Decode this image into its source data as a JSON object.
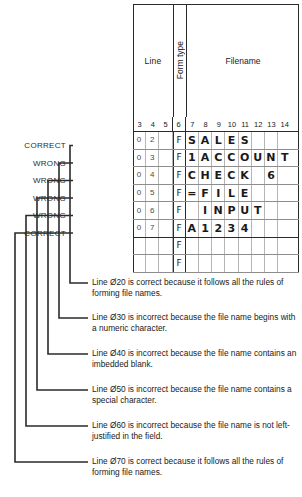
{
  "form": {
    "headers": {
      "line": "Line",
      "form_type": "Form type",
      "filename": "Filename"
    },
    "columns": [
      "3",
      "4",
      "5",
      "6",
      "7",
      "8",
      "9",
      "10",
      "11",
      "12",
      "13",
      "14"
    ],
    "rows": [
      {
        "status": "CORRECT",
        "line_digits": [
          "0",
          "2",
          ""
        ],
        "form_type": "F",
        "filename_cells": [
          "S",
          "A",
          "L",
          "E",
          "S",
          "",
          "",
          ""
        ]
      },
      {
        "status": "WRONG",
        "line_digits": [
          "0",
          "3",
          ""
        ],
        "form_type": "F",
        "filename_cells": [
          "1",
          "A",
          "C",
          "C",
          "O",
          "U",
          "N",
          "T"
        ]
      },
      {
        "status": "WRONG",
        "line_digits": [
          "0",
          "4",
          ""
        ],
        "form_type": "F",
        "filename_cells": [
          "C",
          "H",
          "E",
          "C",
          "K",
          "",
          "6",
          ""
        ]
      },
      {
        "status": "WRONG",
        "line_digits": [
          "0",
          "5",
          ""
        ],
        "form_type": "F",
        "filename_cells": [
          "=",
          "F",
          "I",
          "L",
          "E",
          "",
          "",
          ""
        ]
      },
      {
        "status": "WRONG",
        "line_digits": [
          "0",
          "6",
          ""
        ],
        "form_type": "F",
        "filename_cells": [
          "",
          "I",
          "N",
          "P",
          "U",
          "T",
          "",
          ""
        ]
      },
      {
        "status": "CORRECT",
        "line_digits": [
          "0",
          "7",
          ""
        ],
        "form_type": "F",
        "filename_cells": [
          "A",
          "1",
          "2",
          "3",
          "4",
          "",
          "",
          ""
        ]
      },
      {
        "status": "",
        "line_digits": [
          "",
          "",
          ""
        ],
        "form_type": "F",
        "filename_cells": [
          "",
          "",
          "",
          "",
          "",
          "",
          "",
          ""
        ]
      },
      {
        "status": "",
        "line_digits": [
          "",
          "",
          ""
        ],
        "form_type": "F",
        "filename_cells": [
          "",
          "",
          "",
          "",
          "",
          "",
          "",
          ""
        ]
      }
    ]
  },
  "notes": [
    "Line Ø20 is correct because it follows all the rules of forming file names.",
    "Line Ø30 is incorrect because the file name begins with a numeric character.",
    "Line Ø40 is incorrect because the file name contains an imbedded blank.",
    "Line Ø50 is incorrect because the file name contains a special character.",
    "Line Ø60 is incorrect because the file name is not left-justified in the field.",
    "Line Ø70 is correct because it follows all the rules of forming file names."
  ],
  "colors": {
    "ink": "#1a1a1a",
    "rule": "#2b2b2b",
    "grid_light": "#b5b5b5",
    "page": "#ffffff"
  }
}
